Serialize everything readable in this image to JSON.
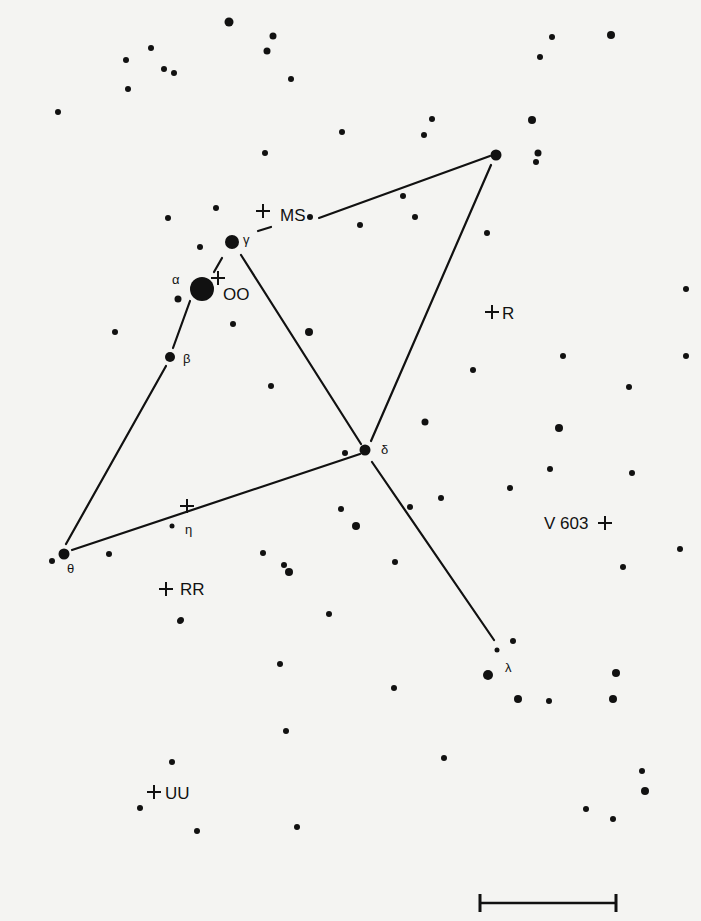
{
  "chart_data": {
    "type": "scatter",
    "title": "",
    "colors": {
      "background": "#f4f4f2",
      "ink": "#111111"
    },
    "greek_stars": [
      {
        "id": "alpha",
        "label": "α",
        "x": 202,
        "y": 289,
        "r": 12,
        "label_x": 172,
        "label_y": 284
      },
      {
        "id": "beta",
        "label": "β",
        "x": 170,
        "y": 357,
        "r": 5,
        "label_x": 183,
        "label_y": 363
      },
      {
        "id": "gamma",
        "label": "γ",
        "x": 232,
        "y": 242,
        "r": 7,
        "label_x": 243,
        "label_y": 244
      },
      {
        "id": "delta",
        "label": "δ",
        "x": 365,
        "y": 450,
        "r": 5.5,
        "label_x": 381,
        "label_y": 454
      },
      {
        "id": "eta",
        "label": "η",
        "x": 172,
        "y": 526,
        "r": 2.5,
        "label_x": 185,
        "label_y": 534
      },
      {
        "id": "theta",
        "label": "θ",
        "x": 64,
        "y": 554,
        "r": 5.5,
        "label_x": 67,
        "label_y": 573
      },
      {
        "id": "lambda",
        "label": "λ",
        "x": 497,
        "y": 650,
        "r": 2.5,
        "label_x": 505,
        "label_y": 672
      },
      {
        "id": "top",
        "label": "",
        "x": 496,
        "y": 155,
        "r": 5.5,
        "label_x": 0,
        "label_y": 0
      }
    ],
    "variable_stars": [
      {
        "label": "MS",
        "cross_x": 263,
        "cross_y": 211,
        "label_x": 280,
        "label_y": 221
      },
      {
        "label": "OO",
        "cross_x": 218,
        "cross_y": 278,
        "label_x": 223,
        "label_y": 300
      },
      {
        "label": "R",
        "cross_x": 492,
        "cross_y": 312,
        "label_x": 502,
        "label_y": 319
      },
      {
        "label": "V 603",
        "cross_x": 605,
        "cross_y": 523,
        "label_x": 544,
        "label_y": 529,
        "label_before": true
      },
      {
        "label": "RR",
        "cross_x": 166,
        "cross_y": 589,
        "label_x": 180,
        "label_y": 595
      },
      {
        "label": "UU",
        "cross_x": 154,
        "cross_y": 792,
        "label_x": 165,
        "label_y": 799
      },
      {
        "label": "",
        "cross_x": 187,
        "cross_y": 506,
        "label_x": 0,
        "label_y": 0
      }
    ],
    "lines": [
      {
        "from": [
          214,
          272
        ],
        "to": [
          222,
          258
        ]
      },
      {
        "from": [
          190,
          301
        ],
        "to": [
          173,
          348
        ]
      },
      {
        "from": [
          166,
          366
        ],
        "to": [
          66,
          544
        ]
      },
      {
        "from": [
          72,
          550
        ],
        "to": [
          360,
          454
        ]
      },
      {
        "from": [
          241,
          255
        ],
        "to": [
          361,
          444
        ]
      },
      {
        "from": [
          371,
          441
        ],
        "to": [
          491,
          165
        ]
      },
      {
        "from": [
          319,
          218
        ],
        "to": [
          490,
          156
        ]
      },
      {
        "from": [
          258,
          231
        ],
        "to": [
          271,
          227
        ]
      },
      {
        "from": [
          372,
          462
        ],
        "to": [
          494,
          640
        ]
      }
    ],
    "field_stars": [
      [
        229,
        22,
        4.5
      ],
      [
        273,
        36,
        3.5
      ],
      [
        267,
        51,
        3.5
      ],
      [
        151,
        48,
        3
      ],
      [
        126,
        60,
        3
      ],
      [
        164,
        69,
        3
      ],
      [
        174,
        73,
        3
      ],
      [
        128,
        89,
        3
      ],
      [
        291,
        79,
        3
      ],
      [
        58,
        112,
        3
      ],
      [
        552,
        37,
        3
      ],
      [
        611,
        35,
        4
      ],
      [
        540,
        57,
        3
      ],
      [
        532,
        120,
        4
      ],
      [
        432,
        119,
        3
      ],
      [
        424,
        135,
        3
      ],
      [
        342,
        132,
        3
      ],
      [
        265,
        153,
        3
      ],
      [
        538,
        153,
        3.5
      ],
      [
        536,
        162,
        3
      ],
      [
        403,
        196,
        3
      ],
      [
        310,
        217,
        3
      ],
      [
        360,
        225,
        3
      ],
      [
        415,
        217,
        3
      ],
      [
        487,
        233,
        3
      ],
      [
        168,
        218,
        3
      ],
      [
        216,
        208,
        3
      ],
      [
        200,
        247,
        3
      ],
      [
        178,
        299,
        3.5
      ],
      [
        115,
        332,
        3
      ],
      [
        233,
        324,
        3
      ],
      [
        309,
        332,
        4
      ],
      [
        686,
        289,
        3
      ],
      [
        563,
        356,
        3
      ],
      [
        686,
        356,
        3
      ],
      [
        473,
        370,
        3
      ],
      [
        629,
        387,
        3
      ],
      [
        271,
        386,
        3
      ],
      [
        345,
        453,
        3
      ],
      [
        425,
        422,
        3.5
      ],
      [
        559,
        428,
        4
      ],
      [
        550,
        469,
        3
      ],
      [
        632,
        473,
        3
      ],
      [
        441,
        498,
        3
      ],
      [
        510,
        488,
        3
      ],
      [
        341,
        509,
        3
      ],
      [
        410,
        507,
        3
      ],
      [
        356,
        526,
        4
      ],
      [
        395,
        562,
        3
      ],
      [
        109,
        554,
        3
      ],
      [
        52,
        561,
        3
      ],
      [
        263,
        553,
        3
      ],
      [
        289,
        572,
        4
      ],
      [
        680,
        549,
        3
      ],
      [
        623,
        567,
        3
      ],
      [
        181,
        620,
        3
      ],
      [
        180,
        621,
        3
      ],
      [
        284,
        565,
        3
      ],
      [
        329,
        614,
        3
      ],
      [
        513,
        641,
        3
      ],
      [
        488,
        675,
        5
      ],
      [
        518,
        699,
        4
      ],
      [
        549,
        701,
        3
      ],
      [
        616,
        673,
        4
      ],
      [
        613,
        699,
        4
      ],
      [
        280,
        664,
        3
      ],
      [
        394,
        688,
        3
      ],
      [
        286,
        731,
        3
      ],
      [
        444,
        758,
        3
      ],
      [
        172,
        762,
        3
      ],
      [
        642,
        771,
        3
      ],
      [
        645,
        791,
        4
      ],
      [
        586,
        809,
        3
      ],
      [
        613,
        819,
        3
      ],
      [
        140,
        808,
        3
      ],
      [
        197,
        831,
        3
      ],
      [
        297,
        827,
        3
      ],
      [
        90,
        25,
        0
      ]
    ],
    "scale_bar": {
      "x1": 480,
      "x2": 616,
      "y": 903,
      "tick_half": 9
    }
  }
}
